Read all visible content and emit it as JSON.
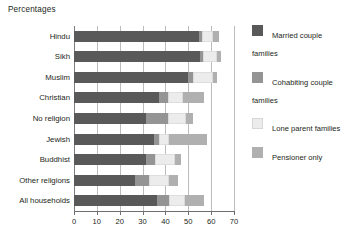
{
  "chart_data": {
    "type": "bar",
    "orientation": "horizontal",
    "stacked": true,
    "title": "Percentages",
    "xlabel": "",
    "ylabel": "",
    "xlim": [
      0,
      70
    ],
    "xticks": [
      0,
      10,
      20,
      30,
      40,
      50,
      60,
      70
    ],
    "grid": true,
    "legend_position": "right",
    "categories": [
      "Hindu",
      "Sikh",
      "Muslim",
      "Christian",
      "No religion",
      "Jewish",
      "Buddhist",
      "Other religions",
      "All households"
    ],
    "series": [
      {
        "name": "Married couple families",
        "color": "#595959",
        "values": [
          54.5,
          55.0,
          50.0,
          37.0,
          31.5,
          35.0,
          31.5,
          26.5,
          36.5
        ]
      },
      {
        "name": "Cohabiting couple families",
        "color": "#949494",
        "values": [
          1.5,
          1.5,
          2.0,
          4.0,
          9.5,
          2.0,
          4.0,
          6.5,
          5.0
        ]
      },
      {
        "name": "Lone parent families",
        "color": "#ececec",
        "values": [
          5.0,
          6.0,
          9.0,
          6.5,
          8.0,
          4.5,
          8.5,
          8.5,
          7.0
        ]
      },
      {
        "name": "Pensioner only",
        "color": "#b0b0b0",
        "values": [
          2.5,
          2.0,
          1.5,
          9.5,
          3.0,
          16.5,
          3.0,
          4.0,
          8.5
        ]
      }
    ],
    "totals": [
      63.5,
      64.5,
      62.5,
      57.0,
      52.0,
      58.0,
      47.0,
      45.5,
      57.0
    ]
  },
  "legend": {
    "items": [
      {
        "label": "Married couple families"
      },
      {
        "label": "Cohabiting couple families"
      },
      {
        "label": "Lone parent families"
      },
      {
        "label": "Pensioner only"
      }
    ]
  },
  "axis": {
    "tick_labels": [
      "0",
      "10",
      "20",
      "30",
      "40",
      "50",
      "60",
      "70"
    ]
  }
}
